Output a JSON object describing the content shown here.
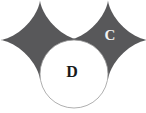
{
  "figure": {
    "background_color": "#ffffff",
    "width": 146,
    "height": 113,
    "shapes": [
      {
        "id": "left-star",
        "kind": "four-pointed-concave-star",
        "fill": "#58585a",
        "stroke": "none",
        "center_x": 40,
        "center_y": 40,
        "radius_x": 40,
        "radius_y": 40,
        "label": ""
      },
      {
        "id": "right-star",
        "kind": "four-pointed-concave-star",
        "fill": "#58585a",
        "stroke": "none",
        "center_x": 108,
        "center_y": 40,
        "radius_x": 40,
        "radius_y": 40,
        "label": "C"
      },
      {
        "id": "center-circle",
        "kind": "circle",
        "fill": "#ffffff",
        "stroke": "#9a9a9a",
        "center_x": 74,
        "center_y": 74,
        "radius": 34,
        "label": "D"
      }
    ],
    "labels": [
      {
        "id": "label-c",
        "text": "C",
        "x": 110,
        "y": 35,
        "color": "#f2f2f2",
        "font_size": 15
      },
      {
        "id": "label-d",
        "text": "D",
        "x": 72,
        "y": 71,
        "color": "#1a1a1a",
        "font_size": 16
      }
    ]
  }
}
